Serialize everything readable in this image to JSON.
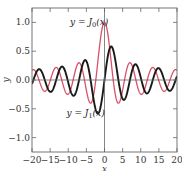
{
  "chart_data": {
    "type": "line",
    "title": "",
    "xlabel": "x",
    "ylabel": "y",
    "xlim": [
      -20,
      20
    ],
    "ylim": [
      -1.25,
      1.25
    ],
    "xticks": [
      -20,
      -15,
      -10,
      -5,
      0,
      5,
      10,
      15,
      20
    ],
    "xtick_labels": [
      "−20",
      "−15",
      "−10",
      "−5",
      "0",
      "5",
      "10",
      "15",
      "20"
    ],
    "yticks": [
      -1.0,
      -0.5,
      0.0,
      0.5,
      1.0
    ],
    "ytick_labels": [
      "−1.0",
      "−0.5",
      "0.0",
      "0.5",
      "1.0"
    ],
    "grid": false,
    "series": [
      {
        "name": "y = J0(x)",
        "function": "besselJ0",
        "color": "#d9506a",
        "key_points": [
          [
            0,
            1.0
          ],
          [
            2.405,
            0.0
          ],
          [
            3.83,
            -0.403
          ],
          [
            7.02,
            0.3
          ],
          [
            10.17,
            -0.25
          ],
          [
            13.32,
            0.218
          ],
          [
            16.47,
            -0.196
          ],
          [
            19.62,
            0.18
          ]
        ]
      },
      {
        "name": "y = J1(x)",
        "function": "besselJ1",
        "color": "#1a1a1a",
        "key_points": [
          [
            0,
            0.0
          ],
          [
            1.84,
            0.582
          ],
          [
            5.33,
            -0.346
          ],
          [
            8.54,
            0.273
          ],
          [
            11.71,
            -0.233
          ],
          [
            14.86,
            0.207
          ],
          [
            18.02,
            -0.188
          ]
        ]
      }
    ],
    "annotations": [
      {
        "text_prefix": "y = J",
        "subscript": "0",
        "text_suffix": "(x)",
        "x": -9.5,
        "y": 0.95
      },
      {
        "text_prefix": "y = J",
        "subscript": "1",
        "text_suffix": "(x)",
        "x": -10.5,
        "y": -0.62
      }
    ]
  }
}
